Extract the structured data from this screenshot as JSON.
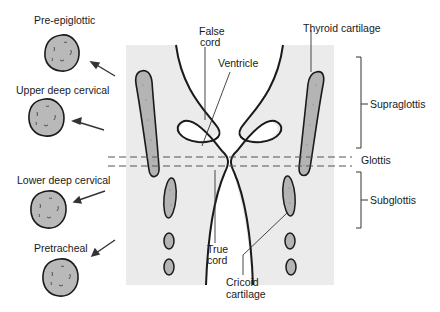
{
  "diagram": {
    "type": "anatomical-diagram",
    "colors": {
      "background": "#ffffff",
      "tissue": "#ebebeb",
      "cartilage": "#b4b4b4",
      "node": "#b9b9b9",
      "outline": "#1a1a1a",
      "dashed": "#555555"
    },
    "lymph_nodes": [
      {
        "label": "Pre-epiglottic"
      },
      {
        "label": "Upper deep cervical"
      },
      {
        "label": "Lower deep cervical"
      },
      {
        "label": "Pretracheal"
      }
    ],
    "structure_labels": {
      "false_cord_line1": "False",
      "false_cord_line2": "cord",
      "ventricle": "Ventricle",
      "thyroid_cartilage": "Thyroid cartilage",
      "true_cord_line1": "True",
      "true_cord_line2": "cord",
      "cricoid_line1": "Cricoid",
      "cricoid_line2": "cartilage"
    },
    "regions": [
      {
        "label": "Supraglottis"
      },
      {
        "label": "Glottis"
      },
      {
        "label": "Subglottis"
      }
    ]
  }
}
